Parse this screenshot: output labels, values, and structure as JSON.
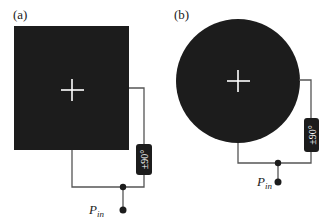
{
  "panels": [
    {
      "label": "(a)",
      "shape": "square",
      "phase_shifter_label": "±90°",
      "port_label": "P",
      "port_subscript": "in"
    },
    {
      "label": "(b)",
      "shape": "circle",
      "phase_shifter_label": "±90°",
      "port_label": "P",
      "port_subscript": "in"
    }
  ],
  "colors": {
    "patch": "#1c1c1c",
    "wire": "#555555",
    "crosshair": "#ffffff",
    "background": "#ffffff"
  }
}
